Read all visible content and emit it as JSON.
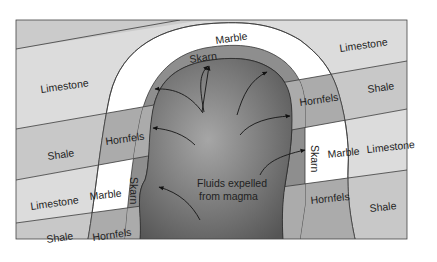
{
  "diagram": {
    "colors": {
      "limestone": "#d9d9d9",
      "shale": "#c6c6c6",
      "marble": "#ffffff",
      "hornfels": "#a9a9a9",
      "skarn": "#8c8c8c",
      "magma_center": "#a0a0a0",
      "magma_edge": "#5c5c5c",
      "line": "#3a3a3a",
      "background": "#ffffff"
    },
    "labels": {
      "marble_top": "Marble",
      "limestone_top_left": "Limestone",
      "limestone_top_right": "Limestone",
      "skarn_top": "Skarn",
      "hornfels_right_upper": "Hornfels",
      "shale_right_upper": "Shale",
      "shale_left_upper": "Shale",
      "hornfels_left_upper": "Hornfels",
      "skarn_right": "Skarn",
      "marble_right": "Marble",
      "limestone_right_mid": "Limestone",
      "limestone_left_mid": "Limestone",
      "marble_left": "Marble",
      "skarn_left": "Skarn",
      "magma_caption_line1": "Fluids expelled",
      "magma_caption_line2": "from magma",
      "hornfels_right_lower": "Hornfels",
      "shale_right_lower": "Shale",
      "shale_left_lower": "Shale",
      "hornfels_left_lower": "Hornfels"
    },
    "rock_types": [
      "Limestone",
      "Shale",
      "Marble",
      "Hornfels",
      "Skarn",
      "Magma"
    ],
    "arrows_count": 9
  }
}
